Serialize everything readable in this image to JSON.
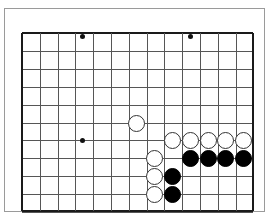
{
  "diagram": {
    "type": "go-board-position",
    "title": "",
    "board": {
      "columns": 13,
      "rows": 10,
      "origin_x": 22,
      "origin_y": 33,
      "spacing_x": 17.8,
      "spacing_y": 17.9,
      "line_color": "#565656",
      "edge_color": "#1a1a1a",
      "background_color": "#ffffff",
      "frame_color": "#9a9a9a",
      "edges": {
        "top": true,
        "left": true,
        "right": true,
        "bottom": true
      }
    },
    "star_points": [
      {
        "col": 3.42,
        "row": 0.17
      },
      {
        "col": 9.44,
        "row": 0.17
      },
      {
        "col": 3.42,
        "row": 6.03
      }
    ],
    "stones": [
      {
        "color": "white",
        "col": 6.46,
        "row": 5.03
      },
      {
        "color": "white",
        "col": 8.43,
        "row": 6.03
      },
      {
        "color": "white",
        "col": 9.44,
        "row": 6.03
      },
      {
        "color": "white",
        "col": 10.45,
        "row": 6.03
      },
      {
        "color": "white",
        "col": 11.46,
        "row": 6.03
      },
      {
        "color": "white",
        "col": 12.47,
        "row": 6.03
      },
      {
        "color": "white",
        "col": 7.44,
        "row": 7.03
      },
      {
        "color": "white",
        "col": 7.44,
        "row": 8.03
      },
      {
        "color": "white",
        "col": 7.44,
        "row": 9.0
      },
      {
        "color": "black",
        "col": 9.44,
        "row": 7.03
      },
      {
        "color": "black",
        "col": 10.45,
        "row": 7.03
      },
      {
        "color": "black",
        "col": 11.46,
        "row": 7.03
      },
      {
        "color": "black",
        "col": 12.47,
        "row": 7.03
      },
      {
        "color": "black",
        "col": 8.43,
        "row": 8.03
      },
      {
        "color": "black",
        "col": 8.43,
        "row": 9.0
      }
    ],
    "counts": {
      "black_stones": 6,
      "white_stones": 9,
      "star_points": 3
    }
  }
}
